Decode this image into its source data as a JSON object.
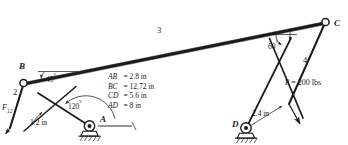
{
  "figure": {
    "type": "mechanism-linkage-diagram",
    "background_color": "#ffffff",
    "line_color": "#1a1a1a"
  },
  "joints": [
    {
      "id": "B",
      "label": "B",
      "kind": "pin-circle",
      "x": 23,
      "y": 83
    },
    {
      "id": "C",
      "label": "C",
      "kind": "pin-circle",
      "x": 326,
      "y": 22
    },
    {
      "id": "A",
      "label": "A",
      "kind": "grounded-pin-support",
      "x": 90,
      "y": 126
    },
    {
      "id": "D",
      "label": "D",
      "kind": "grounded-pin-support",
      "x": 245,
      "y": 128
    }
  ],
  "links": [
    {
      "id": "3",
      "label": "3",
      "from": "B",
      "to": "C"
    },
    {
      "id": "2",
      "label": "2",
      "from": "B",
      "to": "F12-line"
    },
    {
      "id": "4",
      "label": "4",
      "from": "C",
      "to": "P-line"
    }
  ],
  "angles": [
    {
      "id": "angle-45",
      "label": "45",
      "unit": "°",
      "at": "B"
    },
    {
      "id": "angle-120",
      "label": "120",
      "unit": "°",
      "at": "A"
    },
    {
      "id": "angle-60",
      "label": "60",
      "unit": "°",
      "at": "C"
    }
  ],
  "forces": [
    {
      "id": "F12",
      "symbol": "F",
      "subscript": "12",
      "at": "link-2-lower-end"
    },
    {
      "id": "P",
      "label": "P = 200 lbs",
      "at": "link-4-lower-end"
    }
  ],
  "offsets": [
    {
      "id": "offset-1_2in",
      "label": "1.2 in",
      "near": "A"
    },
    {
      "id": "offset-2_4in",
      "label": "2.4 in",
      "near": "D"
    }
  ],
  "dimensions": {
    "rows": [
      {
        "segment": "AB",
        "equals": "=",
        "value": "2.8 in"
      },
      {
        "segment": "BC",
        "equals": "=",
        "value": "12.72 in"
      },
      {
        "segment": "CD",
        "equals": "=",
        "value": "5.6 in"
      },
      {
        "segment": "AD",
        "equals": "=",
        "value": "8 in"
      }
    ]
  }
}
